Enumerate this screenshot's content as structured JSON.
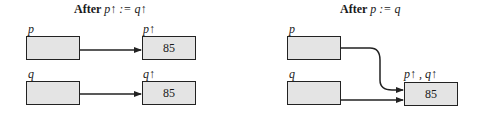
{
  "left_panel": {
    "title_prefix": "After",
    "title_expr": "p↑ := q↑",
    "pointer_p_label": "p",
    "pointer_q_label": "q",
    "target_p_label": "p↑",
    "target_q_label": "q↑",
    "target_p_value": "85",
    "target_q_value": "85"
  },
  "right_panel": {
    "title_prefix": "After",
    "title_expr": "p := q",
    "pointer_p_label": "p",
    "pointer_q_label": "q",
    "shared_target_label": "p↑ , q↑",
    "shared_target_value": "85"
  }
}
